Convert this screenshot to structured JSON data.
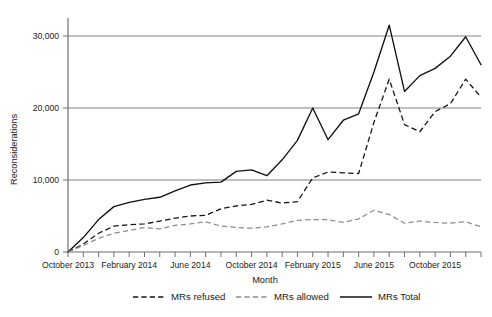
{
  "chart_data": {
    "type": "line",
    "title": "",
    "xlabel": "Month",
    "ylabel": "Reconsiderations",
    "ylim": [
      0,
      32500
    ],
    "yticks": [
      0,
      10000,
      20000,
      30000
    ],
    "ytick_labels": [
      "0",
      "10,000",
      "20,000",
      "30,000"
    ],
    "grid": true,
    "grid_axis": "y",
    "legend_position": "bottom",
    "x": [
      "October 2013",
      "November 2013",
      "December 2013",
      "January 2014",
      "February 2014",
      "March 2014",
      "April 2014",
      "May 2014",
      "June 2014",
      "July 2014",
      "August 2014",
      "September 2014",
      "October 2014",
      "November 2014",
      "December 2014",
      "January 2015",
      "February 2015",
      "March 2015",
      "April 2015",
      "May 2015",
      "June 2015",
      "July 2015",
      "August 2015",
      "September 2015",
      "October 2015",
      "November 2015",
      "December 2015",
      "January 2016"
    ],
    "xtick_labels": [
      "October 2013",
      "February 2014",
      "June 2014",
      "October 2014",
      "February 2015",
      "June 2015",
      "October 2015"
    ],
    "xtick_label_indices": [
      0,
      4,
      8,
      12,
      16,
      20,
      24
    ],
    "series": [
      {
        "name": "MRs refused",
        "style": "dashed",
        "color": "#141414",
        "values": [
          0,
          1100,
          2600,
          3600,
          3800,
          3900,
          4300,
          4700,
          5000,
          5100,
          6000,
          6400,
          6600,
          7200,
          6800,
          7000,
          10300,
          11100,
          11000,
          10900,
          18000,
          24000,
          17700,
          16700,
          19500,
          20600,
          24000,
          21500
        ]
      },
      {
        "name": "MRs allowed",
        "style": "dashed",
        "color": "#8c8c8c",
        "values": [
          0,
          900,
          1900,
          2600,
          3000,
          3400,
          3200,
          3700,
          3900,
          4200,
          3600,
          3400,
          3300,
          3500,
          3900,
          4400,
          4500,
          4500,
          4100,
          4600,
          5800,
          5200,
          4000,
          4300,
          4100,
          4000,
          4200,
          3500
        ]
      },
      {
        "name": "MRs Total",
        "style": "solid",
        "color": "#111111",
        "values": [
          0,
          2000,
          4500,
          6300,
          6900,
          7300,
          7600,
          8500,
          9300,
          9600,
          9700,
          11200,
          11400,
          10600,
          12800,
          15500,
          20000,
          15600,
          18300,
          19200,
          25000,
          31500,
          22300,
          24500,
          25500,
          27200,
          29900,
          26000
        ]
      }
    ]
  },
  "axes": {
    "y_title": "Reconsiderations",
    "x_title": "Month"
  },
  "legend": {
    "items": [
      {
        "label": "MRs refused",
        "style": "dashed",
        "color": "#141414"
      },
      {
        "label": "MRs allowed",
        "style": "dashed",
        "color": "#8c8c8c"
      },
      {
        "label": "MRs Total",
        "style": "solid",
        "color": "#111111"
      }
    ]
  }
}
